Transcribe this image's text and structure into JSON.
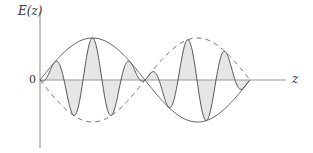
{
  "figure": {
    "y_axis_label": "E(z)",
    "x_axis_label": "z",
    "origin_label": "0",
    "colors": {
      "axis": "#888888",
      "wave": "#555555",
      "envelope_solid": "#666666",
      "envelope_dashed": "#777777",
      "fill": "#e6e6e6"
    },
    "geometry": {
      "origin_x": 40,
      "zero_y": 80,
      "envelope_half_period_px": 105,
      "envelope_amplitude_px": 42,
      "carrier_period_px": 38,
      "wave_end_x": 250,
      "axis_end_x": 286
    }
  }
}
